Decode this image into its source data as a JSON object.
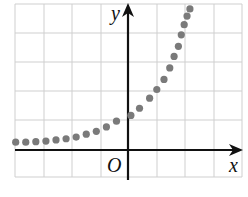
{
  "chart_data": {
    "type": "scatter",
    "title": "",
    "xlabel": "x",
    "ylabel": "y",
    "origin_label": "O",
    "grid": true,
    "xlim": [
      -4,
      4
    ],
    "ylim": [
      -1,
      5
    ],
    "points": [
      [
        -3.9,
        0.27
      ],
      [
        -3.55,
        0.27
      ],
      [
        -3.2,
        0.29
      ],
      [
        -2.85,
        0.31
      ],
      [
        -2.5,
        0.35
      ],
      [
        -2.15,
        0.39
      ],
      [
        -1.8,
        0.45
      ],
      [
        -1.45,
        0.55
      ],
      [
        -1.1,
        0.65
      ],
      [
        -0.75,
        0.8
      ],
      [
        -0.4,
        1.0
      ],
      [
        0.1,
        1.2
      ],
      [
        0.4,
        1.45
      ],
      [
        0.75,
        1.8
      ],
      [
        1.0,
        2.1
      ],
      [
        1.25,
        2.45
      ],
      [
        1.45,
        2.85
      ],
      [
        1.6,
        3.25
      ],
      [
        1.75,
        3.6
      ],
      [
        1.85,
        4.0
      ],
      [
        1.95,
        4.35
      ],
      [
        2.05,
        4.65
      ],
      [
        2.15,
        4.9
      ]
    ],
    "colors": {
      "dots": "#7a7a7a",
      "axes": "#111111",
      "grid": "#cfcfcf"
    }
  }
}
